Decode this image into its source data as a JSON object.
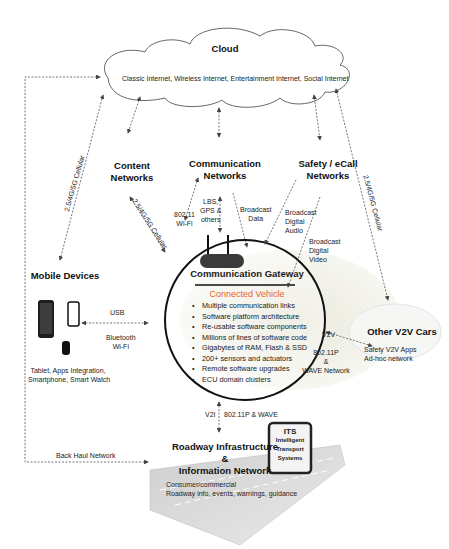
{
  "cloud": {
    "title": "Cloud",
    "subtitle": "Classic Internet, Wireless Internet, Entertainment Internet, Social Internet"
  },
  "nodes": {
    "content_networks": "Content Networks",
    "communication_networks_l1": "Communication",
    "communication_networks_l2": "Networks",
    "safety_l1": "Safety / eCall",
    "safety_l2": "Networks",
    "mobile_devices": "Mobile Devices",
    "mobile_caption_l1": "Tablet, Apps Integration,",
    "mobile_caption_l2": "Smartphone, Smart Watch",
    "other_v2v": "Other V2V Cars",
    "other_v2v_l1": "Safety V2V Apps",
    "other_v2v_l2": "Ad-hoc network",
    "roadway_l1": "Roadway Infrastructure &",
    "roadway_l2": "Information Network",
    "roadway_caption_l1": "Consumer/commercial",
    "roadway_caption_l2": "Roadway info, events, warnings, guidance",
    "its_l1": "ITS",
    "its_l2": "Intelligent",
    "its_l3": "Transport",
    "its_l4": "Systems"
  },
  "gateway": {
    "title": "Communication Gateway",
    "subtitle": "Connected Vehicle",
    "features": [
      "Multiple communication links",
      "Software platform architecture",
      "Re-usable software components",
      "Millions of lines of software code",
      "Gigabytes of RAM, Flash & SSD",
      "200+ sensors and actuators",
      "Remote software upgrades",
      "ECU domain clusters"
    ]
  },
  "links": {
    "cellular_left": "2.5/4G/5G Cellular",
    "cellular_content": "2.5/4G/5G Cellular",
    "cellular_right": "2.5/4G/5G Cellular",
    "wifi_l1": "802.11",
    "wifi_l2": "Wi-Fi",
    "lbs_l1": "LBS,",
    "lbs_l2": "GPS &",
    "lbs_l3": "others",
    "bdata_l1": "Broadcast",
    "bdata_l2": "Data",
    "baudio_l1": "Broadcast",
    "baudio_l2": "Digital",
    "baudio_l3": "Audio",
    "bvideo_l1": "Broadcast",
    "bvideo_l2": "Digital",
    "bvideo_l3": "Video",
    "usb": "USB",
    "bt_l1": "Bluetooth",
    "bt_l2": "Wi-Fi",
    "v2v": "V2V",
    "v2v_net_l1": "802.11P",
    "v2v_net_l2": "&",
    "v2v_net_l3": "WAVE Network",
    "v2i": "V2I",
    "v2i_net": "802.11P & WAVE",
    "backhaul": "Back Haul Network"
  },
  "colors": {
    "accent": "#e8632a",
    "line": "#555555"
  }
}
